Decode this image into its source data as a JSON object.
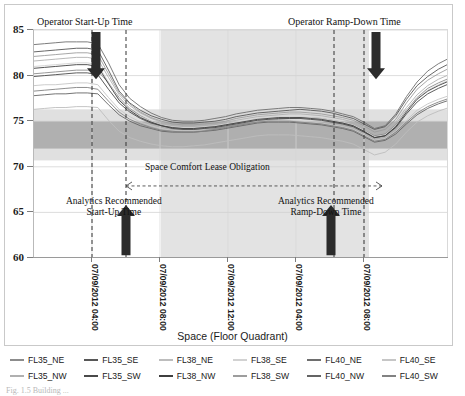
{
  "figure": {
    "caption": "Fig. 1.5  Building ...",
    "background": "#ffffff",
    "frame_color": "#c9c9c9"
  },
  "annotations": {
    "operator_start": "Operator Start-Up Time",
    "operator_ramp": "Operator Ramp-Down Time",
    "lease": "Space Comfort Lease Obligation",
    "analytics_start_line1": "Analytics Recommended",
    "analytics_start_line2": "Start-Up Time",
    "analytics_ramp_line1": "Analytics Recommended",
    "analytics_ramp_line2": "Ramp-Down Time"
  },
  "chart_data": {
    "type": "line",
    "title": "",
    "xlabel": "Space (Floor Quadrant)",
    "ylabel": "",
    "ylim": [
      60,
      85
    ],
    "yticks": [
      60,
      65,
      70,
      75,
      80,
      85
    ],
    "xticks": [
      "07/09/2012 04:00",
      "07/09/2012 08:00",
      "07/09/2012 12:00",
      "07/09/2012 04:00",
      "07/09/2012 08:00"
    ],
    "xtick_positions": [
      91,
      159,
      227,
      295,
      363
    ],
    "grid": true,
    "legend_position": "bottom",
    "comfort_band": {
      "low": 72,
      "high": 75,
      "color": "#a7a7a7"
    },
    "outer_band": {
      "low": 70.7,
      "high": 76.3,
      "color": "#d6d6d6"
    },
    "occupied_shade": {
      "x_start": 160,
      "x_end": 368,
      "color": "#e3e3e3"
    },
    "vlines": [
      {
        "x": 91,
        "label": "operator-start-up"
      },
      {
        "x": 125,
        "label": "analytics-start-up"
      },
      {
        "x": 333,
        "label": "analytics-ramp-down"
      },
      {
        "x": 363,
        "label": "operator-ramp-down"
      }
    ],
    "arrows": [
      {
        "x": 95,
        "direction": "down",
        "label": "operator-start-up-arrow"
      },
      {
        "x": 375,
        "direction": "down",
        "label": "operator-ramp-down-arrow"
      },
      {
        "x": 125,
        "direction": "up",
        "label": "analytics-start-up-arrow"
      },
      {
        "x": 330,
        "direction": "up",
        "label": "analytics-ramp-down-arrow"
      }
    ],
    "series": [
      {
        "name": "FL35_NE",
        "color": "#8c8c8c",
        "values": [
          80.2,
          80.3,
          80.4,
          80.5,
          80.6,
          80.6,
          80.5,
          79.2,
          77.6,
          76.4,
          75.6,
          75.0,
          74.6,
          74.3,
          74.2,
          74.1,
          74.1,
          74.2,
          74.4,
          74.6,
          74.8,
          75.0,
          75.1,
          75.2,
          75.3,
          75.4,
          75.4,
          75.3,
          75.1,
          74.9,
          74.6,
          74.0,
          73.4,
          73.6,
          74.6,
          76.2,
          77.6,
          78.6,
          79.2,
          79.7
        ]
      },
      {
        "name": "FL35_SE",
        "color": "#575757",
        "values": [
          82.6,
          82.7,
          82.8,
          82.9,
          83.0,
          83.0,
          82.8,
          80.6,
          78.3,
          77.0,
          76.2,
          75.6,
          75.2,
          74.9,
          74.8,
          74.8,
          74.9,
          75.0,
          75.2,
          75.5,
          75.7,
          75.9,
          76.0,
          76.1,
          76.2,
          76.3,
          76.2,
          76.1,
          75.9,
          75.6,
          75.3,
          74.7,
          74.1,
          74.4,
          75.6,
          77.4,
          78.9,
          79.9,
          80.7,
          81.3
        ]
      },
      {
        "name": "FL38_NE",
        "color": "#bdbdbd",
        "values": [
          76.3,
          76.4,
          76.5,
          76.5,
          76.6,
          76.6,
          76.5,
          75.1,
          73.9,
          73.2,
          72.8,
          72.5,
          72.3,
          72.2,
          72.2,
          72.3,
          72.4,
          72.6,
          72.8,
          73.0,
          73.2,
          73.4,
          73.5,
          73.5,
          73.5,
          73.4,
          73.3,
          73.2,
          73.0,
          72.8,
          72.5,
          71.9,
          71.3,
          71.6,
          72.5,
          73.8,
          74.9,
          75.6,
          76.1,
          76.5
        ]
      },
      {
        "name": "FL38_SE",
        "color": "#d2d2d2",
        "values": [
          81.0,
          81.1,
          81.2,
          81.3,
          81.4,
          81.4,
          81.2,
          79.3,
          77.4,
          76.3,
          75.5,
          75.0,
          74.6,
          74.4,
          74.3,
          74.3,
          74.4,
          74.5,
          74.7,
          74.9,
          75.1,
          75.3,
          75.4,
          75.5,
          75.5,
          75.5,
          75.4,
          75.3,
          75.1,
          74.9,
          74.6,
          74.0,
          73.3,
          73.5,
          74.5,
          76.1,
          77.5,
          78.4,
          79.0,
          79.5
        ]
      },
      {
        "name": "FL40_NE",
        "color": "#6e6e6e",
        "values": [
          83.4,
          83.5,
          83.6,
          83.7,
          83.7,
          83.7,
          83.5,
          81.4,
          79.0,
          77.5,
          76.6,
          75.9,
          75.4,
          75.1,
          75.0,
          75.0,
          75.1,
          75.3,
          75.5,
          75.8,
          76.0,
          76.2,
          76.3,
          76.4,
          76.5,
          76.5,
          76.4,
          76.3,
          76.1,
          75.8,
          75.5,
          74.9,
          74.2,
          74.5,
          75.8,
          77.7,
          79.3,
          80.5,
          81.3,
          81.9
        ]
      },
      {
        "name": "FL40_SE",
        "color": "#c6c6c6",
        "values": [
          78.9,
          79.0,
          79.0,
          79.1,
          79.2,
          79.2,
          79.0,
          77.6,
          76.3,
          75.5,
          74.9,
          74.5,
          74.2,
          74.0,
          74.0,
          74.0,
          74.1,
          74.3,
          74.5,
          74.7,
          74.9,
          75.0,
          75.1,
          75.1,
          75.1,
          75.0,
          74.9,
          74.8,
          74.6,
          74.4,
          74.1,
          73.5,
          72.9,
          73.1,
          73.9,
          75.1,
          76.2,
          76.9,
          77.4,
          77.8
        ]
      },
      {
        "name": "FL35_NW",
        "color": "#b0b0b0",
        "values": [
          81.6,
          81.7,
          81.8,
          81.9,
          82.0,
          82.0,
          81.8,
          79.8,
          77.9,
          76.7,
          75.9,
          75.3,
          74.9,
          74.6,
          74.5,
          74.5,
          74.6,
          74.7,
          74.9,
          75.1,
          75.3,
          75.5,
          75.6,
          75.7,
          75.8,
          75.8,
          75.7,
          75.6,
          75.4,
          75.2,
          74.9,
          74.3,
          73.7,
          73.9,
          74.9,
          76.5,
          77.9,
          78.9,
          79.6,
          80.1
        ]
      },
      {
        "name": "FL35_SW",
        "color": "#4a4a4a",
        "values": [
          79.9,
          80.0,
          80.1,
          80.2,
          80.3,
          80.3,
          80.1,
          78.5,
          77.0,
          76.0,
          75.3,
          74.8,
          74.5,
          74.2,
          74.1,
          74.1,
          74.2,
          74.3,
          74.5,
          74.7,
          74.9,
          75.1,
          75.2,
          75.3,
          75.3,
          75.3,
          75.2,
          75.1,
          74.9,
          74.7,
          74.4,
          73.8,
          73.2,
          73.4,
          74.3,
          75.8,
          77.1,
          78.0,
          78.6,
          79.1
        ]
      },
      {
        "name": "FL38_NW",
        "color": "#3f3f3f",
        "values": [
          80.8,
          80.9,
          81.0,
          81.1,
          81.2,
          81.2,
          81.0,
          79.1,
          77.3,
          76.2,
          75.4,
          74.9,
          74.5,
          74.3,
          74.2,
          74.2,
          74.3,
          74.4,
          74.6,
          74.8,
          75.0,
          75.2,
          75.3,
          75.4,
          75.4,
          75.4,
          75.3,
          75.2,
          75.0,
          74.8,
          74.5,
          73.9,
          73.2,
          73.4,
          74.4,
          76.0,
          77.4,
          78.3,
          78.9,
          79.4
        ]
      },
      {
        "name": "FL38_SW",
        "color": "#9d9d9d",
        "values": [
          82.1,
          82.2,
          82.3,
          82.4,
          82.5,
          82.5,
          82.3,
          80.2,
          78.1,
          76.9,
          76.0,
          75.4,
          75.0,
          74.7,
          74.6,
          74.6,
          74.7,
          74.8,
          75.0,
          75.3,
          75.5,
          75.7,
          75.8,
          75.9,
          76.0,
          76.0,
          75.9,
          75.8,
          75.6,
          75.4,
          75.1,
          74.5,
          73.8,
          74.1,
          75.2,
          77.0,
          78.5,
          79.5,
          80.2,
          80.8
        ]
      },
      {
        "name": "FL40_NW",
        "color": "#646464",
        "values": [
          77.8,
          77.9,
          78.0,
          78.0,
          78.1,
          78.1,
          78.0,
          76.8,
          75.7,
          75.0,
          74.5,
          74.2,
          73.9,
          73.8,
          73.8,
          73.8,
          73.9,
          74.0,
          74.2,
          74.4,
          74.6,
          74.8,
          74.9,
          74.9,
          74.9,
          74.8,
          74.7,
          74.6,
          74.4,
          74.2,
          73.9,
          73.3,
          72.7,
          72.9,
          73.6,
          74.7,
          75.7,
          76.4,
          76.9,
          77.3
        ]
      },
      {
        "name": "FL40_SW",
        "color": "#828282",
        "values": [
          78.3,
          78.4,
          78.5,
          78.6,
          78.7,
          78.7,
          78.5,
          77.2,
          76.0,
          75.2,
          74.7,
          74.3,
          74.0,
          73.9,
          73.8,
          73.8,
          73.9,
          74.1,
          74.3,
          74.5,
          74.7,
          74.9,
          75.0,
          75.0,
          75.0,
          74.9,
          74.8,
          74.7,
          74.5,
          74.3,
          74.0,
          73.4,
          72.8,
          73.0,
          73.8,
          74.9,
          75.9,
          76.6,
          77.1,
          77.5
        ]
      }
    ]
  }
}
